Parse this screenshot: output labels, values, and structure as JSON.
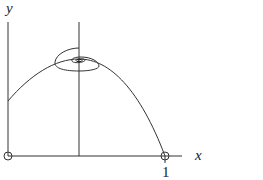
{
  "diagram": {
    "type": "phase-portrait",
    "axes": {
      "x_label": "x",
      "y_label": "y",
      "x_tick_labels": [
        "1"
      ]
    },
    "equilibria": [
      {
        "name": "origin",
        "x": 0,
        "y": 0,
        "marker": "open-circle"
      },
      {
        "name": "x-equals-one",
        "x": 1,
        "y": 0,
        "marker": "open-circle"
      },
      {
        "name": "interior-spiral-point",
        "marker": "spiral-sink"
      }
    ],
    "curves": [
      {
        "name": "parabolic-nullcline",
        "shape": "downward parabola"
      },
      {
        "name": "vertical-nullcline",
        "shape": "vertical line"
      },
      {
        "name": "spiral-trajectory",
        "shape": "inward spiral"
      }
    ],
    "colors": {
      "stroke": "#333333",
      "background": "#ffffff"
    }
  }
}
